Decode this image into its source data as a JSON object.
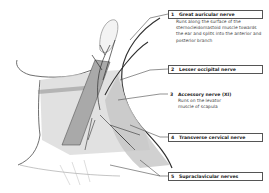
{
  "figure": {
    "colors": {
      "line": "#4a4a4a",
      "skin_shade": "#bdbdbd",
      "muscle": "#9a9a9a",
      "nerve": "#2e2e2e",
      "background": "#ffffff"
    },
    "labels": [
      {
        "number": "1",
        "title": "Great auricular nerve",
        "description": "Runs along the surface of the sternocleidomastoid muscle towards the ear and splits into the anterior and posterior branch",
        "boxed": true
      },
      {
        "number": "2",
        "title": "Lesser occipital nerve",
        "description": "",
        "boxed": true
      },
      {
        "number": "3",
        "title": "Accessory nerve (XI)",
        "description": "Runs on the levator muscle of scapula",
        "boxed": false
      },
      {
        "number": "4",
        "title": "Transverse cervical nerve",
        "description": "",
        "boxed": true
      },
      {
        "number": "5",
        "title": "Supraclavicular nerves",
        "description": "",
        "boxed": true
      }
    ]
  }
}
